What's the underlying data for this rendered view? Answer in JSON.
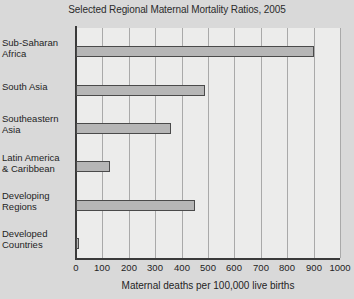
{
  "chart_data": {
    "type": "bar",
    "orientation": "horizontal",
    "title": "Selected Regional Maternal Mortality Ratios, 2005",
    "xlabel": "Maternal deaths per 100,000 live births",
    "ylabel": "",
    "xlim": [
      0,
      1000
    ],
    "xticks": [
      "0",
      "100",
      "200",
      "300",
      "400",
      "500",
      "600",
      "700",
      "800",
      "900",
      "1000"
    ],
    "xtick_values": [
      0,
      100,
      200,
      300,
      400,
      500,
      600,
      700,
      800,
      900,
      1000
    ],
    "grid": "vertical",
    "legend": "none",
    "categories": [
      "Sub-Saharan Africa",
      "South Asia",
      "Southeastern Asia",
      "Latin America & Caribbean",
      "Developing Regions",
      "Developed Countries"
    ],
    "category_lines": [
      [
        "Sub-Saharan",
        "Africa"
      ],
      [
        "South Asia"
      ],
      [
        "Southeastern",
        "Asia"
      ],
      [
        "Latin America",
        "& Caribbean"
      ],
      [
        "Developing",
        "Regions"
      ],
      [
        "Developed",
        "Countries"
      ]
    ],
    "values": [
      900,
      490,
      360,
      130,
      450,
      9
    ],
    "bar_color": "#b6b6b6",
    "bar_edge_color": "#4a4a4a",
    "plot_background": "#ececeb",
    "figure_background": "#d9d9d9"
  }
}
